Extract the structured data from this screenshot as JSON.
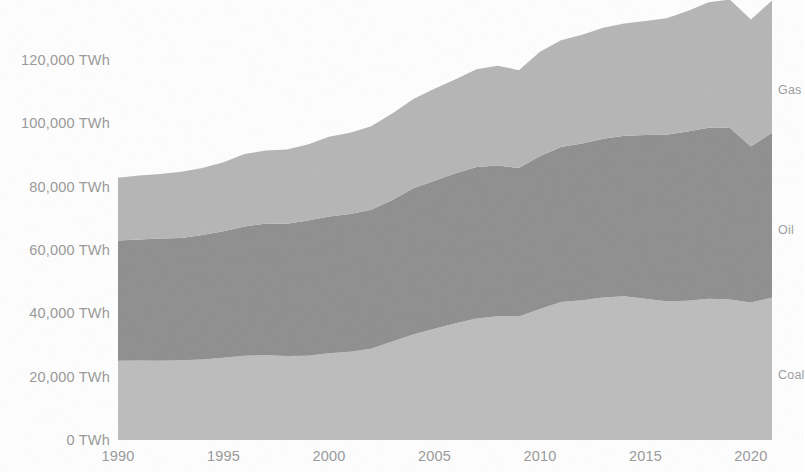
{
  "chart_data": {
    "type": "area",
    "stacked": true,
    "title": "",
    "subtitle": "",
    "xlabel": "",
    "ylabel": "",
    "unit": "TWh",
    "grid": false,
    "legend_position": "right-inline",
    "xlim": [
      1990,
      2021
    ],
    "ylim": [
      0,
      140000
    ],
    "y_ticks": [
      0,
      20000,
      40000,
      60000,
      80000,
      100000,
      120000
    ],
    "y_tick_labels": [
      "0 TWh",
      "20,000 TWh",
      "40,000 TWh",
      "60,000 TWh",
      "80,000 TWh",
      "100,000 TWh",
      "120,000 TWh"
    ],
    "x_ticks": [
      1990,
      1995,
      2000,
      2005,
      2010,
      2015,
      2020
    ],
    "x_tick_labels": [
      "1990",
      "1995",
      "2000",
      "2005",
      "2010",
      "2015",
      "2020"
    ],
    "x": [
      1990,
      1991,
      1992,
      1993,
      1994,
      1995,
      1996,
      1997,
      1998,
      1999,
      2000,
      2001,
      2002,
      2003,
      2004,
      2005,
      2006,
      2007,
      2008,
      2009,
      2010,
      2011,
      2012,
      2013,
      2014,
      2015,
      2016,
      2017,
      2018,
      2019,
      2020,
      2021
    ],
    "series": [
      {
        "name": "Coal",
        "color": "#bcbcbc",
        "label_value": 41000,
        "values": [
          25000,
          25100,
          25000,
          25200,
          25400,
          26000,
          26600,
          26800,
          26500,
          26600,
          27400,
          27900,
          28800,
          31100,
          33300,
          35100,
          36900,
          38400,
          39100,
          39000,
          41400,
          43600,
          44100,
          45000,
          45400,
          44600,
          43800,
          44000,
          44600,
          44400,
          43400,
          45000
        ]
      },
      {
        "name": "Oil",
        "color": "#8e8e8e",
        "label_value": 52000,
        "values": [
          38000,
          38200,
          38600,
          38600,
          39300,
          39900,
          40800,
          41600,
          41800,
          42700,
          43200,
          43500,
          43900,
          44700,
          46200,
          46800,
          47300,
          47800,
          47600,
          46900,
          48300,
          48900,
          49500,
          50100,
          50700,
          51700,
          52600,
          53400,
          54000,
          54200,
          49300,
          52000
        ]
      },
      {
        "name": "Gas",
        "color": "#b5b5b5",
        "label_value": 40000,
        "values": [
          19800,
          20200,
          20400,
          20900,
          21200,
          21800,
          22900,
          23000,
          23400,
          24000,
          25200,
          25600,
          26400,
          27300,
          28200,
          29000,
          29700,
          30900,
          31500,
          30900,
          32900,
          33700,
          34400,
          35100,
          35400,
          36000,
          36800,
          38100,
          39600,
          40500,
          40100,
          41800
        ]
      }
    ],
    "series_labels": [
      {
        "name": "Gas",
        "y_px": 90
      },
      {
        "name": "Oil",
        "y_px": 230
      },
      {
        "name": "Coal",
        "y_px": 375
      }
    ],
    "colors": {
      "coal": "#bcbcbc",
      "oil": "#8e8e8e",
      "gas": "#b5b5b5",
      "axis_text": "#9a9a9a",
      "series_text": "#9e9e9e",
      "background": "#ffffff"
    }
  }
}
